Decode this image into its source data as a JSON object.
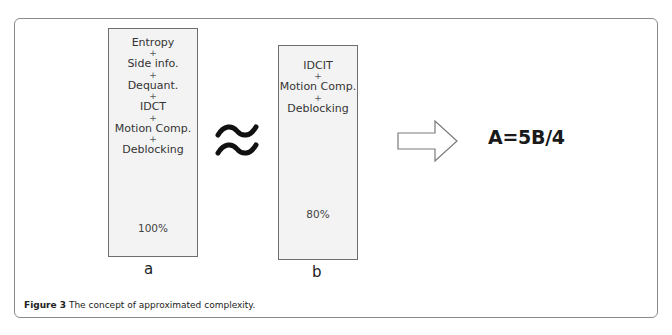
{
  "figure": {
    "caption_label": "Figure 3",
    "caption_text": " The concept of approximated complexity."
  },
  "box_a": {
    "items": [
      "Entropy",
      "Side info.",
      "Dequant.",
      "IDCT",
      "Motion Comp.",
      "Deblocking"
    ],
    "separator": "+",
    "percentage": "100%",
    "label": "a"
  },
  "box_b": {
    "items": [
      "IDCIT",
      "Motion Comp.",
      "Deblocking"
    ],
    "separator": "+",
    "percentage": "80%",
    "label": "b"
  },
  "relation_symbol": "approx-equal-icon",
  "arrow_icon": "right-arrow-icon",
  "formula": "A=5B/4"
}
